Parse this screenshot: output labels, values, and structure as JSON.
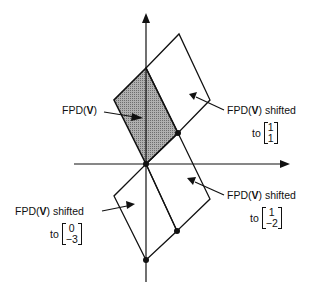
{
  "figure": {
    "labels": [
      {
        "id": "fpd",
        "prefix": "FPD(",
        "bold": "V",
        "suffix": ")",
        "shift": "",
        "vector": []
      },
      {
        "id": "shift11",
        "prefix": "FPD(",
        "bold": "V",
        "suffix": ")",
        "shift": " shifted",
        "to": "to",
        "vector": [
          "1",
          "1"
        ]
      },
      {
        "id": "shift1m2",
        "prefix": "FPD(",
        "bold": "V",
        "suffix": ")",
        "shift": " shifted",
        "to": "to",
        "vector": [
          "1",
          "−2"
        ]
      },
      {
        "id": "shift0m3",
        "prefix": "FPD(",
        "bold": "V",
        "suffix": ")",
        "shift": " shifted",
        "to": "to",
        "vector": [
          "0",
          "−3"
        ]
      }
    ],
    "colors": {
      "line": "#111111",
      "shade": "#8c8c8c"
    }
  }
}
